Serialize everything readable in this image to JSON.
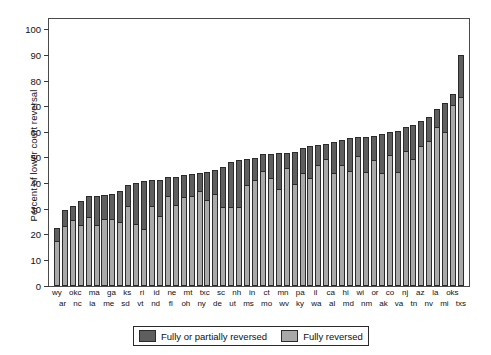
{
  "chart_data": {
    "type": "bar",
    "title": "",
    "xlabel": "",
    "ylabel": "Percent of lower court reversal",
    "ylim": [
      0,
      105
    ],
    "yticks": [
      0,
      10,
      20,
      30,
      40,
      50,
      60,
      70,
      80,
      90,
      100
    ],
    "grid": false,
    "stacked": true,
    "legend_position": "bottom-center",
    "legend": [
      "Fully or partially reversed",
      "Fully reversed"
    ],
    "colors": {
      "fully_or_partially_reversed": "#5e5e5e",
      "fully_reversed": "#a9a9a9",
      "outline": "#2b2b2b",
      "axis": "#4a4a4a"
    },
    "categories": [
      "wy",
      "ar",
      "okc",
      "nc",
      "ma",
      "ia",
      "ga",
      "me",
      "ks",
      "sd",
      "ri",
      "vt",
      "id",
      "nd",
      "ne",
      "fl",
      "mt",
      "oh",
      "txc",
      "ny",
      "sc",
      "de",
      "nh",
      "ut",
      "in",
      "ms",
      "ct",
      "mo",
      "mn",
      "wv",
      "pa",
      "ky",
      "il",
      "wa",
      "ca",
      "al",
      "hi",
      "md",
      "wi",
      "nm",
      "or",
      "ak",
      "co",
      "va",
      "nj",
      "tn",
      "az",
      "nv",
      "la",
      "mi",
      "oks",
      "txs"
    ],
    "series": [
      {
        "name": "Fully or partially reversed",
        "values": [
          22.5,
          29.7,
          31.2,
          33.0,
          35.0,
          35.3,
          35.6,
          35.8,
          36.9,
          39.4,
          40.2,
          41.0,
          41.2,
          41.3,
          42.4,
          42.7,
          43.3,
          43.6,
          44.0,
          44.4,
          45.4,
          46.6,
          48.4,
          49.0,
          49.6,
          50.0,
          51.6,
          51.6,
          51.8,
          52.0,
          52.2,
          53.8,
          54.8,
          55.0,
          55.6,
          56.2,
          57.0,
          57.6,
          58.0,
          58.2,
          58.4,
          59.4,
          60.0,
          60.6,
          62.2,
          63.0,
          64.6,
          66.0,
          69.0,
          71.6,
          74.8,
          90.2
        ]
      },
      {
        "name": "Fully reversed",
        "values": [
          17.5,
          23.4,
          25.8,
          23.8,
          27.0,
          24.0,
          26.3,
          26.0,
          25.0,
          31.2,
          24.4,
          22.2,
          31.2,
          27.4,
          35.2,
          31.6,
          34.6,
          35.2,
          37.2,
          33.6,
          35.8,
          30.9,
          31.0,
          31.0,
          39.6,
          41.2,
          45.0,
          42.2,
          38.0,
          46.2,
          40.0,
          44.0,
          42.0,
          47.2,
          49.4,
          44.0,
          47.4,
          45.0,
          50.8,
          44.6,
          49.2,
          44.0,
          51.0,
          44.6,
          52.6,
          49.6,
          54.6,
          56.6,
          62.0,
          60.0,
          70.8,
          73.6
        ]
      }
    ],
    "xtick_rows": {
      "top": [
        "wy",
        "",
        "okc",
        "",
        "ma",
        "",
        "ga",
        "",
        "ks",
        "",
        "ri",
        "",
        "id",
        "",
        "ne",
        "",
        "mt",
        "",
        "txc",
        "",
        "sc",
        "",
        "nh",
        "",
        "in",
        "",
        "ct",
        "",
        "mn",
        "",
        "pa",
        "",
        "il",
        "",
        "ca",
        "",
        "hi",
        "",
        "wi",
        "",
        "or",
        "",
        "co",
        "",
        "nj",
        "",
        "az",
        "",
        "la",
        "",
        "oks",
        ""
      ],
      "bottom": [
        "",
        "ar",
        "",
        "nc",
        "",
        "ia",
        "",
        "me",
        "",
        "sd",
        "",
        "vt",
        "",
        "nd",
        "",
        "fl",
        "",
        "oh",
        "",
        "ny",
        "",
        "de",
        "",
        "ut",
        "",
        "ms",
        "",
        "mo",
        "",
        "wv",
        "",
        "ky",
        "",
        "wa",
        "",
        "al",
        "",
        "md",
        "",
        "nm",
        "",
        "ak",
        "",
        "va",
        "",
        "tn",
        "",
        "nv",
        "",
        "mi",
        "",
        "txs"
      ]
    }
  }
}
